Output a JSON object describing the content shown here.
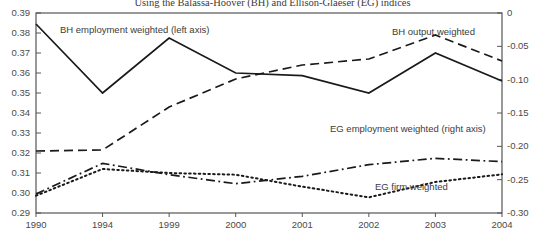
{
  "chart_data": {
    "type": "line",
    "title": "Using the Balassa-Hoover (BH) and Ellison-Glaeser (EG) indices",
    "xlabel": "",
    "ylabel": "",
    "categories": [
      "1990",
      "1994",
      "1999",
      "2000",
      "2001",
      "2002",
      "2003",
      "2004"
    ],
    "grid": false,
    "legend_position": "inline-annotations",
    "axes": {
      "left": {
        "label": "",
        "ticks": [
          "0.39",
          "0.38",
          "0.37",
          "0.36",
          "0.35",
          "0.34",
          "0.33",
          "0.32",
          "0.31",
          "0.30",
          "0.29"
        ],
        "ylim": [
          0.29,
          0.39
        ],
        "step": 0.01
      },
      "right": {
        "label": "",
        "ticks": [
          "0",
          "-0.05",
          "-0.10",
          "-0.15",
          "-0.20",
          "-0.25",
          "-0.30"
        ],
        "ylim": [
          -0.3,
          0.0
        ],
        "step": 0.05
      }
    },
    "series": [
      {
        "name": "BH employment weighted (left axis)",
        "axis": "left",
        "style": "solid",
        "color": "#1a1a1a",
        "values": [
          0.3845,
          0.35,
          0.3775,
          0.36,
          0.3587,
          0.35,
          0.37,
          0.356
        ]
      },
      {
        "name": "BH output weighted",
        "axis": "left",
        "style": "dashed",
        "color": "#1a1a1a",
        "values": [
          0.321,
          0.3215,
          0.343,
          0.357,
          0.364,
          0.367,
          0.379,
          0.366
        ]
      },
      {
        "name": "EG employment weighted (right axis)",
        "axis": "right",
        "style": "dash-dot",
        "color": "#1a1a1a",
        "values": [
          -0.2715,
          -0.2255,
          -0.2425,
          -0.256,
          -0.245,
          -0.2275,
          -0.218,
          -0.223
        ]
      },
      {
        "name": "EG firm weighted",
        "axis": "right",
        "style": "dotted",
        "color": "#1a1a1a",
        "values": [
          -0.274,
          -0.234,
          -0.24,
          -0.2425,
          -0.2605,
          -0.2765,
          -0.2535,
          -0.242
        ]
      }
    ],
    "annotations": [
      {
        "text": "BH employment weighted (left axis)",
        "x_px": 60,
        "y_px": 24
      },
      {
        "text": "BH output weighted",
        "x_px": 392,
        "y_px": 26
      },
      {
        "text": "EG employment weighted (right axis)",
        "x_px": 330,
        "y_px": 123
      },
      {
        "text": "EG firm weighted",
        "x_px": 375,
        "y_px": 181
      }
    ]
  }
}
